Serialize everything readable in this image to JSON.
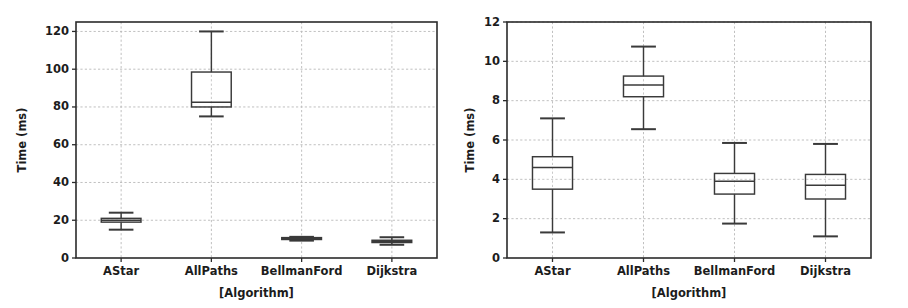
{
  "figure": {
    "width": 908,
    "height": 308,
    "background": "#ffffff",
    "panel_count": 2,
    "box_stroke_color": "#3a3a3a",
    "grid_color": "#b9b9b9",
    "axis_color": "#2b2b2b"
  },
  "chart_data": [
    {
      "type": "box",
      "panel": "left",
      "title": "",
      "xlabel": "[Algorithm]",
      "ylabel": "Time (ms)",
      "categories": [
        "AStar",
        "AllPaths",
        "BellmanFord",
        "Dijkstra"
      ],
      "ylim": [
        0,
        125
      ],
      "yticks": [
        0,
        20,
        40,
        60,
        80,
        100,
        120
      ],
      "ytick_labels": [
        "0",
        "20",
        "40",
        "60",
        "80",
        "100",
        "120"
      ],
      "grid": true,
      "legend": "none",
      "boxes": [
        {
          "label": "AStar",
          "whisker_low": 15.0,
          "q1": 19.0,
          "median": 20.0,
          "q3": 21.0,
          "whisker_high": 24.0
        },
        {
          "label": "AllPaths",
          "whisker_low": 75.0,
          "q1": 80.0,
          "median": 82.5,
          "q3": 98.5,
          "whisker_high": 120.0
        },
        {
          "label": "BellmanFord",
          "whisker_low": 9.2,
          "q1": 9.8,
          "median": 10.3,
          "q3": 10.8,
          "whisker_high": 11.2
        },
        {
          "label": "Dijkstra",
          "whisker_low": 7.0,
          "q1": 8.2,
          "median": 8.8,
          "q3": 9.4,
          "whisker_high": 11.0
        }
      ]
    },
    {
      "type": "box",
      "panel": "right",
      "title": "",
      "xlabel": "[Algorithm]",
      "ylabel": "Time (ms)",
      "categories": [
        "AStar",
        "AllPaths",
        "BellmanFord",
        "Dijkstra"
      ],
      "ylim": [
        0,
        12
      ],
      "yticks": [
        0,
        2,
        4,
        6,
        8,
        10,
        12
      ],
      "ytick_labels": [
        "0",
        "2",
        "4",
        "6",
        "8",
        "10",
        "12"
      ],
      "grid": true,
      "legend": "none",
      "boxes": [
        {
          "label": "AStar",
          "whisker_low": 1.3,
          "q1": 3.5,
          "median": 4.6,
          "q3": 5.15,
          "whisker_high": 7.1
        },
        {
          "label": "AllPaths",
          "whisker_low": 6.55,
          "q1": 8.2,
          "median": 8.8,
          "q3": 9.25,
          "whisker_high": 10.75
        },
        {
          "label": "BellmanFord",
          "whisker_low": 1.75,
          "q1": 3.25,
          "median": 3.9,
          "q3": 4.3,
          "whisker_high": 5.85
        },
        {
          "label": "Dijkstra",
          "whisker_low": 1.1,
          "q1": 3.0,
          "median": 3.7,
          "q3": 4.25,
          "whisker_high": 5.8
        }
      ]
    }
  ]
}
